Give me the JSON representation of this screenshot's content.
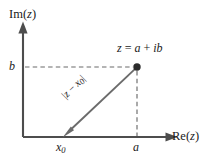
{
  "figure": {
    "type": "complex-plane-diagram",
    "background_color": "#ffffff",
    "line_color": "#4d4d4d",
    "text_color": "#1a1a1a",
    "width": 217,
    "height": 159,
    "axes": {
      "y_axis_label": "Im(z)",
      "y_axis_label_text": "Im(",
      "y_axis_label_var": "z",
      "y_axis_label_close": ")",
      "x_axis_label": "Re(z)",
      "x_axis_label_text": "Re(",
      "x_axis_label_var": "z",
      "x_axis_label_close": ")",
      "origin_px": {
        "x": 23,
        "y": 137
      },
      "x_axis_end_px": {
        "x": 178,
        "y": 137
      },
      "y_axis_end_px": {
        "x": 23,
        "y": 22
      }
    },
    "point": {
      "label": "z = a + ib",
      "label_lhs": "z",
      "label_eq": " = ",
      "label_re": "a",
      "label_plus": " + ",
      "label_im": "ib",
      "px": {
        "x": 137,
        "y": 67
      },
      "marker": "filled-circle",
      "marker_radius": 3.6
    },
    "ticks": {
      "y_value_label": "b",
      "x_origin_label": "x",
      "x_origin_sub": "0",
      "x_point_label": "a",
      "x0_px": {
        "x": 63,
        "y": 137
      },
      "a_px": {
        "x": 137,
        "y": 137
      },
      "b_px": {
        "x": 23,
        "y": 67
      }
    },
    "vector": {
      "label": "|z − x0|",
      "label_open": "|",
      "label_z": "z",
      "label_minus": " − ",
      "label_x": "x",
      "label_x_sub": "0",
      "label_close": "|",
      "from_px": {
        "x": 137,
        "y": 67
      },
      "to_px": {
        "x": 63,
        "y": 137
      },
      "arrowhead_at": "to",
      "rotation_deg": -45
    },
    "guides": [
      {
        "name": "horizontal-dashed-b",
        "style": "dashed",
        "from": {
          "x": 24,
          "y": 67
        },
        "to": {
          "x": 134,
          "y": 67
        }
      },
      {
        "name": "vertical-dashed-a",
        "style": "dashed",
        "from": {
          "x": 137,
          "y": 70
        },
        "to": {
          "x": 137,
          "y": 136
        }
      }
    ]
  }
}
